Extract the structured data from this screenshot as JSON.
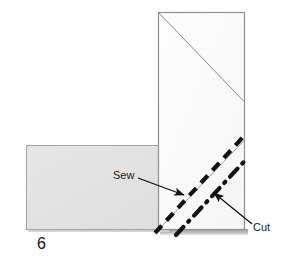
{
  "figure": {
    "step_number": "6",
    "labels": {
      "sew": "Sew",
      "cut": "Cut"
    },
    "colors": {
      "background": "#ffffff",
      "left_panel_fill": "#e2e2e2",
      "vertical_panel_fill": "#fbfbfb",
      "panel_stroke": "#9a9a9a",
      "fold_line": "#8c8c8c",
      "sew_line": "#111111",
      "cut_line": "#111111",
      "arrow": "#111111",
      "shadow": "#b4b4b4",
      "text": "#1a1a1a"
    },
    "shapes": [
      {
        "name": "left-fabric-panel",
        "type": "rectangle",
        "x": 26,
        "y": 145,
        "width": 142,
        "height": 85,
        "fill": "#e2e2e2"
      },
      {
        "name": "vertical-fabric-panel",
        "type": "rectangle",
        "x": 158,
        "y": 12,
        "width": 87,
        "height": 218,
        "fill": "#fbfbfb"
      }
    ],
    "lines": [
      {
        "name": "upper-fold-line",
        "type": "solid-thin",
        "x1": 158,
        "y1": 12,
        "x2": 245,
        "y2": 102
      },
      {
        "name": "lower-fold-line",
        "type": "solid-thin",
        "x1": 158,
        "y1": 230,
        "x2": 245,
        "y2": 140
      },
      {
        "name": "sew-stitch-line",
        "type": "dashed-thick",
        "x1": 155,
        "y1": 233,
        "x2": 244,
        "y2": 137
      },
      {
        "name": "cut-line",
        "type": "dash-dot-thick",
        "x1": 177,
        "y1": 234,
        "x2": 245,
        "y2": 162
      }
    ],
    "arrows": [
      {
        "name": "sew-callout-arrow",
        "x1": 137,
        "y1": 178,
        "x2": 186,
        "y2": 196
      },
      {
        "name": "cut-callout-arrow",
        "x1": 251,
        "y1": 224,
        "x2": 213,
        "y2": 192
      }
    ]
  }
}
